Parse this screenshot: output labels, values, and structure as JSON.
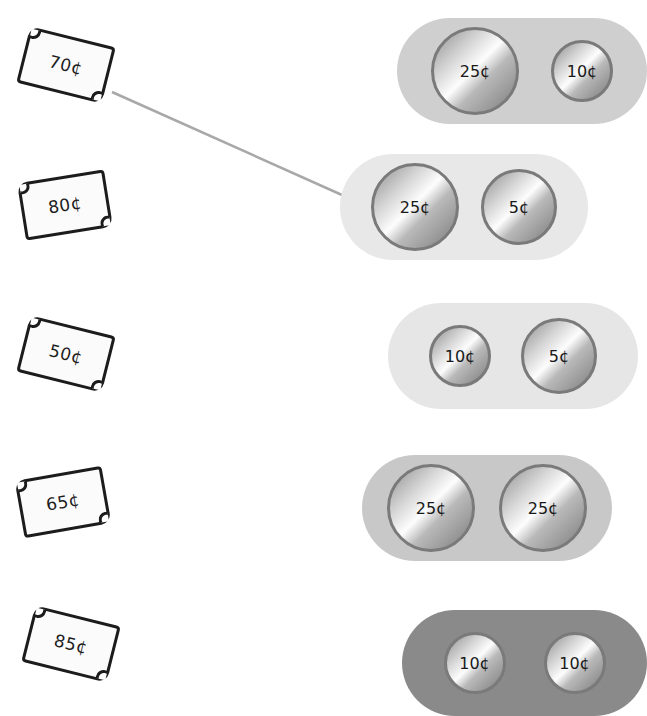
{
  "tickets": [
    {
      "label": "70¢"
    },
    {
      "label": "80¢"
    },
    {
      "label": "50¢"
    },
    {
      "label": "65¢"
    },
    {
      "label": "85¢"
    }
  ],
  "coin_groups": [
    {
      "color": "#cfcfcf",
      "coins": [
        {
          "label": "25¢"
        },
        {
          "label": "10¢"
        }
      ]
    },
    {
      "color": "#e8e8e8",
      "coins": [
        {
          "label": "25¢"
        },
        {
          "label": "5¢"
        }
      ]
    },
    {
      "color": "#e6e6e6",
      "coins": [
        {
          "label": "10¢"
        },
        {
          "label": "5¢"
        }
      ]
    },
    {
      "color": "#c8c8c8",
      "coins": [
        {
          "label": "25¢"
        },
        {
          "label": "25¢"
        }
      ]
    },
    {
      "color": "#8a8a8a",
      "coins": [
        {
          "label": "10¢"
        },
        {
          "label": "10¢"
        }
      ]
    }
  ],
  "connections": [
    {
      "from_ticket": "70¢",
      "to_group": "25¢ + 5¢",
      "color": "#a8a8a8"
    }
  ]
}
